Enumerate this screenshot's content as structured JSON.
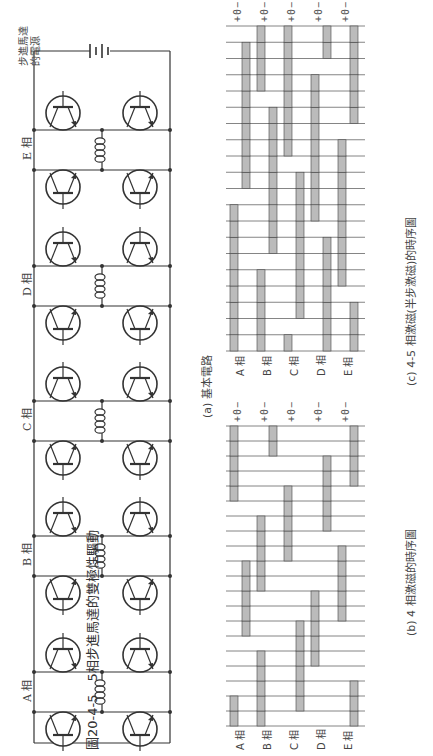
{
  "figure_caption": "圖20-4-5　5相步進馬達的雙極性驅動",
  "circuit": {
    "title": "(a) 基本電路",
    "power_supply_label": [
      "步進馬達",
      "的電源"
    ],
    "phases": [
      {
        "label": "A 相"
      },
      {
        "label": "B 相"
      },
      {
        "label": "C 相"
      },
      {
        "label": "D 相"
      },
      {
        "label": "E 相"
      }
    ]
  },
  "timing_b": {
    "title": "(b) 4 相激磁的時序圖",
    "row_labels": [
      "A 相",
      "B 相",
      "C 相",
      "D 相",
      "E 相"
    ],
    "level_marks": "+0−",
    "steps": 20,
    "waveforms": {
      "A": [
        1,
        1,
        0,
        0,
        0,
        0,
        -1,
        -1,
        -1,
        -1,
        -1,
        0,
        0,
        0,
        0,
        1,
        1,
        1,
        1,
        1
      ],
      "B": [
        1,
        1,
        1,
        1,
        1,
        0,
        0,
        0,
        0,
        1,
        1,
        1,
        1,
        1,
        0,
        0,
        0,
        0,
        -1,
        -1
      ],
      "C": [
        0,
        -1,
        -1,
        -1,
        -1,
        -1,
        -1,
        0,
        0,
        0,
        0,
        1,
        1,
        1,
        1,
        1,
        0,
        0,
        0,
        0
      ],
      "D": [
        0,
        0,
        0,
        0,
        1,
        1,
        1,
        1,
        1,
        0,
        0,
        0,
        0,
        -1,
        -1,
        -1,
        -1,
        -1,
        0,
        0
      ],
      "E": [
        -1,
        -1,
        -1,
        0,
        0,
        0,
        0,
        1,
        1,
        1,
        1,
        1,
        0,
        0,
        0,
        0,
        -1,
        -1,
        -1,
        -1
      ]
    }
  },
  "timing_c": {
    "title": "(c) 4-5 相激磁(半步激磁)的時序圖",
    "row_labels": [
      "A 相",
      "B 相",
      "C 相",
      "D 相",
      "E 相"
    ],
    "level_marks": "+0−",
    "steps": 20
  }
}
